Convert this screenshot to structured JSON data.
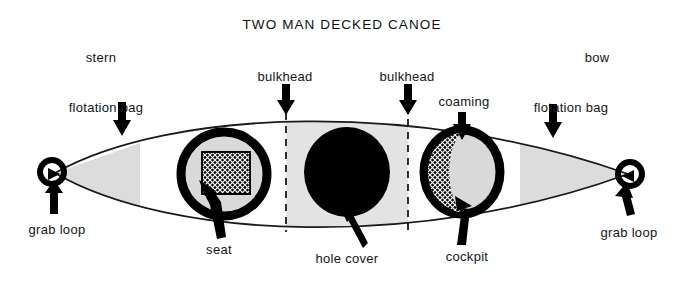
{
  "diagram": {
    "title": "TWO MAN DECKED CANOE",
    "type": "technical-illustration",
    "colors": {
      "ink": "#151515",
      "hull_line": "#1a1a1a",
      "shading": "#dcdcdc",
      "solid_fill": "#000000",
      "background": "#ffffff"
    },
    "labels": {
      "title": "TWO MAN DECKED CANOE",
      "stern": "stern",
      "bow": "bow",
      "flotation_bag_stern": "flotation bag",
      "flotation_bag_bow": "flotation bag",
      "bulkhead_left": "bulkhead",
      "bulkhead_right": "bulkhead",
      "coaming": "coaming",
      "grab_loop_stern": "grab loop",
      "grab_loop_bow": "grab loop",
      "seat": "seat",
      "hole_cover": "hole cover",
      "cockpit": "cockpit"
    },
    "parts": [
      {
        "name": "stern",
        "label": "stern",
        "description": "rear end of the canoe, left side of the drawing",
        "leader": "none"
      },
      {
        "name": "bow",
        "label": "bow",
        "description": "front end of the canoe, right side of the drawing",
        "leader": "none"
      },
      {
        "name": "flotation-bag-stern",
        "label": "flotation bag",
        "description": "light grey shaded tapered region inside the stern end",
        "leader": "arrow-down"
      },
      {
        "name": "flotation-bag-bow",
        "label": "flotation bag",
        "description": "light grey shaded tapered region inside the bow end",
        "leader": "arrow-down"
      },
      {
        "name": "bulkhead-left",
        "label": "bulkhead",
        "description": "vertical dashed divider aft of the hole cover",
        "leader": "arrow-down"
      },
      {
        "name": "bulkhead-right",
        "label": "bulkhead",
        "description": "vertical dashed divider forward of the hole cover",
        "leader": "arrow-down"
      },
      {
        "name": "coaming",
        "label": "coaming",
        "description": "thick raised black rim around the forward cockpit",
        "leader": "arrow-down"
      },
      {
        "name": "grab-loop-stern",
        "label": "grab loop",
        "description": "small ring at the stern tip",
        "leader": "arrow-up"
      },
      {
        "name": "grab-loop-bow",
        "label": "grab loop",
        "description": "small ring at the bow tip",
        "leader": "arrow-up"
      },
      {
        "name": "seat",
        "label": "seat",
        "description": "cross-hatched square pad inside the aft cockpit",
        "leader": "arrow-up"
      },
      {
        "name": "hole-cover",
        "label": "hole cover",
        "description": "solid black oval over the centre hatch between the bulkheads",
        "leader": "arrow-up"
      },
      {
        "name": "cockpit",
        "label": "cockpit",
        "description": "forward opening enclosed by the coaming",
        "leader": "arrow-up"
      }
    ]
  }
}
